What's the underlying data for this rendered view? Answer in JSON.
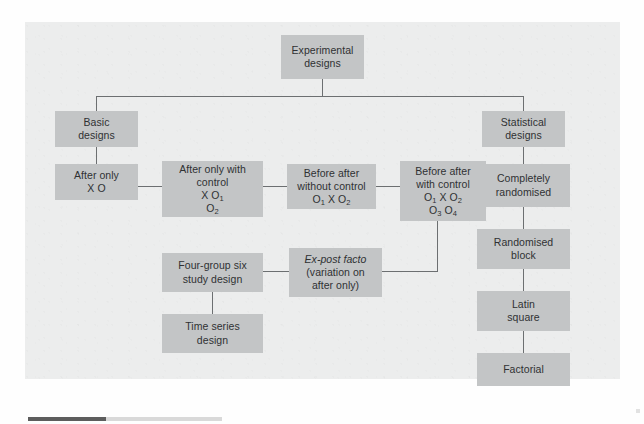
{
  "figure": {
    "type": "tree-diagram",
    "title": "Experimental designs",
    "root": "Experimental\ndesigns",
    "branches": {
      "basic": "Basic\ndesigns",
      "statistical": "Statistical\ndesigns"
    }
  },
  "nodes": {
    "root": "Experimental\ndesigns",
    "basic_designs": "Basic\ndesigns",
    "statistical_designs": "Statistical\ndesigns",
    "after_only_line1": "After only",
    "after_only_line2": "X O",
    "after_only_control_line1": "After only with",
    "after_only_control_line2": "control",
    "after_only_control_line3": "X O",
    "after_only_control_sub3": "1",
    "after_only_control_line4": "O",
    "after_only_control_sub4": "2",
    "before_after_without_line1": "Before after",
    "before_after_without_line2": "without control",
    "before_after_without_line3_a": "O",
    "before_after_without_sub3_a": "1",
    "before_after_without_line3_b": " X O",
    "before_after_without_sub3_b": "2",
    "before_after_with_line1": "Before after",
    "before_after_with_line2": "with control",
    "before_after_with_line3_a": "O",
    "before_after_with_sub3_a": "1",
    "before_after_with_line3_b": " X O",
    "before_after_with_sub3_b": "2",
    "before_after_with_line4_a": "O",
    "before_after_with_sub4_a": "3",
    "before_after_with_line4_b": "   O",
    "before_after_with_sub4_b": "4",
    "four_group": "Four-group six\nstudy design",
    "ex_post_facto_italic": "Ex-post facto",
    "ex_post_facto_rest": "(variation on\nafter only)",
    "time_series": "Time series\ndesign",
    "completely_randomised": "Completely\nrandomised",
    "randomised_block": "Randomised\nblock",
    "latin_square": "Latin\nsquare",
    "factorial": "Factorial"
  },
  "colors": {
    "panel_background": "#eceded",
    "node_fill": "#c3c5c6",
    "node_text": "#2f3133",
    "connector": "#6c6f71",
    "page_background": "#ffffff",
    "footer_bar_dark": "#5d5d5d",
    "footer_bar_light": "#d9d9d9"
  }
}
